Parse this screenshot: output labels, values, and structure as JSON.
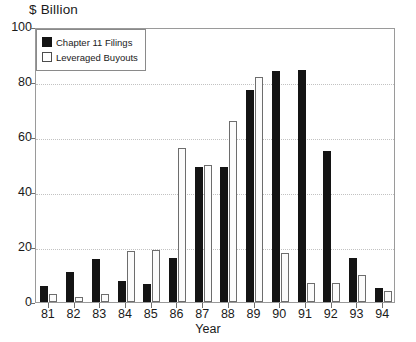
{
  "chart_data": {
    "type": "bar",
    "title": "$ Billion",
    "xlabel": "Year",
    "ylabel": "",
    "ylim": [
      0,
      100
    ],
    "yticks": [
      0,
      20,
      40,
      60,
      80,
      100
    ],
    "grid": "horizontal-dotted",
    "legend_position": "top-left-inside",
    "categories": [
      "81",
      "82",
      "83",
      "84",
      "85",
      "86",
      "87",
      "88",
      "89",
      "90",
      "91",
      "92",
      "93",
      "94"
    ],
    "series": [
      {
        "name": "Chapter 11 Filings",
        "color": "#141414",
        "values": [
          6,
          11,
          15.5,
          7.5,
          6.5,
          16,
          49,
          49,
          77,
          84,
          84.5,
          55,
          16,
          5
        ]
      },
      {
        "name": "Leveraged Buyouts",
        "color": "#ffffff",
        "values": [
          3,
          2,
          3,
          18.5,
          19,
          56,
          50,
          66,
          82,
          18,
          7,
          7,
          10,
          4
        ]
      }
    ]
  },
  "axes": {
    "y_tick_labels": [
      "100",
      "80",
      "60",
      "40",
      "20",
      "0"
    ],
    "x_tick_labels": [
      "81",
      "82",
      "83",
      "84",
      "85",
      "86",
      "87",
      "88",
      "89",
      "90",
      "91",
      "92",
      "93",
      "94"
    ],
    "x_axis_title": "Year"
  },
  "legend": {
    "entries": [
      {
        "label": "Chapter 11 Filings",
        "swatch": "filled-black-square"
      },
      {
        "label": "Leveraged Buyouts",
        "swatch": "open-white-square"
      }
    ]
  },
  "colors": {
    "series_dark": "#141414",
    "series_light": "#ffffff",
    "series_light_edge": "#6d6d6d",
    "gridline": "#c2c2c2",
    "frame": "#9a9a9a",
    "text": "#1a1a1a",
    "background": "#ffffff"
  }
}
